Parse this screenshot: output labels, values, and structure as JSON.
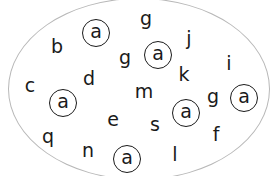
{
  "puzzle": {
    "target_letter": "a",
    "circled_letters": [
      {
        "char": "a",
        "x": 96,
        "y": 33
      },
      {
        "char": "a",
        "x": 158,
        "y": 55
      },
      {
        "char": "a",
        "x": 63,
        "y": 103
      },
      {
        "char": "a",
        "x": 186,
        "y": 113
      },
      {
        "char": "a",
        "x": 244,
        "y": 98
      },
      {
        "char": "a",
        "x": 127,
        "y": 159
      }
    ],
    "other_letters": [
      {
        "char": "b",
        "x": 57,
        "y": 46
      },
      {
        "char": "g",
        "x": 146,
        "y": 18
      },
      {
        "char": "g",
        "x": 125,
        "y": 57
      },
      {
        "char": "j",
        "x": 189,
        "y": 38
      },
      {
        "char": "k",
        "x": 184,
        "y": 74
      },
      {
        "char": "i",
        "x": 229,
        "y": 63
      },
      {
        "char": "c",
        "x": 30,
        "y": 85
      },
      {
        "char": "d",
        "x": 89,
        "y": 78
      },
      {
        "char": "m",
        "x": 144,
        "y": 91
      },
      {
        "char": "g",
        "x": 213,
        "y": 96
      },
      {
        "char": "e",
        "x": 113,
        "y": 119
      },
      {
        "char": "s",
        "x": 155,
        "y": 124
      },
      {
        "char": "f",
        "x": 216,
        "y": 134
      },
      {
        "char": "q",
        "x": 48,
        "y": 136
      },
      {
        "char": "n",
        "x": 88,
        "y": 150
      },
      {
        "char": "l",
        "x": 175,
        "y": 154
      }
    ]
  },
  "colors": {
    "ink": "#1a1a1a",
    "ellipse_stroke": "#b8b8b8",
    "background": "#ffffff"
  }
}
